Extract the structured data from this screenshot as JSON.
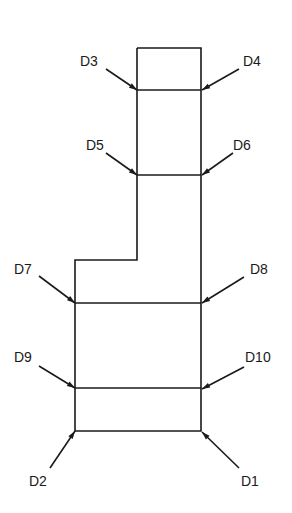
{
  "diagram": {
    "type": "cross-section outline with labeled points",
    "stroke_color": "#1a1a1a",
    "background": "#ffffff",
    "outline_points": [
      [
        137,
        48
      ],
      [
        201,
        48
      ],
      [
        201,
        431
      ],
      [
        75,
        431
      ],
      [
        75,
        260
      ],
      [
        137,
        260
      ],
      [
        137,
        48
      ]
    ],
    "horizontal_lines": [
      {
        "y": 90,
        "x1": 137,
        "x2": 201
      },
      {
        "y": 175,
        "x1": 137,
        "x2": 201
      },
      {
        "y": 303,
        "x1": 75,
        "x2": 201
      },
      {
        "y": 388,
        "x1": 75,
        "x2": 201
      }
    ],
    "labels": [
      {
        "id": "D1",
        "text": "D1",
        "x": 241,
        "y": 486,
        "from": [
          239,
          468
        ],
        "to": [
          202,
          432
        ]
      },
      {
        "id": "D2",
        "text": "D2",
        "x": 29,
        "y": 486,
        "from": [
          50,
          468
        ],
        "to": [
          75,
          431
        ]
      },
      {
        "id": "D3",
        "text": "D3",
        "x": 80,
        "y": 66,
        "from": [
          106,
          69
        ],
        "to": [
          137,
          90
        ]
      },
      {
        "id": "D4",
        "text": "D4",
        "x": 243,
        "y": 66,
        "from": [
          239,
          69
        ],
        "to": [
          202,
          90
        ]
      },
      {
        "id": "D5",
        "text": "D5",
        "x": 86,
        "y": 150,
        "from": [
          106,
          153
        ],
        "to": [
          137,
          175
        ]
      },
      {
        "id": "D6",
        "text": "D6",
        "x": 233,
        "y": 150,
        "from": [
          233,
          153
        ],
        "to": [
          202,
          175
        ]
      },
      {
        "id": "D7",
        "text": "D7",
        "x": 14,
        "y": 274,
        "from": [
          39,
          276
        ],
        "to": [
          75,
          303
        ]
      },
      {
        "id": "D8",
        "text": "D8",
        "x": 250,
        "y": 274,
        "from": [
          244,
          277
        ],
        "to": [
          202,
          303
        ]
      },
      {
        "id": "D9",
        "text": "D9",
        "x": 14,
        "y": 362,
        "from": [
          39,
          366
        ],
        "to": [
          75,
          388
        ]
      },
      {
        "id": "D10",
        "text": "D10",
        "x": 245,
        "y": 362,
        "from": [
          244,
          367
        ],
        "to": [
          202,
          389
        ]
      }
    ]
  }
}
